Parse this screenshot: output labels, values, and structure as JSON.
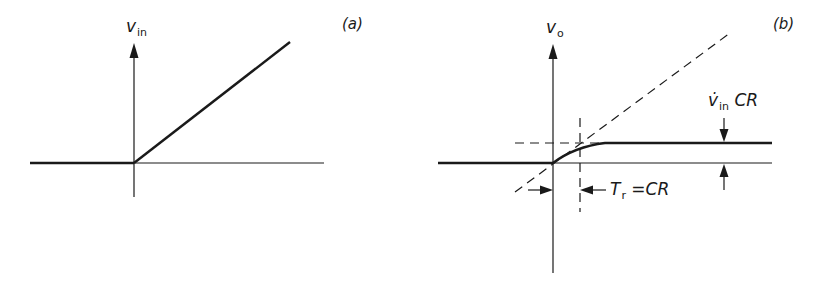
{
  "panels": {
    "a": {
      "tag": "(a)",
      "y_axis_label_main": "v",
      "y_axis_label_sub": "in",
      "description": "Input voltage ramp starting at t=0"
    },
    "b": {
      "tag": "(b)",
      "y_axis_label_main": "v",
      "y_axis_label_sub": "o",
      "amplitude_label_main": "v̇",
      "amplitude_label_sub": "in",
      "amplitude_label_tail": " CR",
      "time_constant_label_main": "T",
      "time_constant_label_sub": "r",
      "time_constant_label_tail": " =CR",
      "description": "Output voltage rising exponentially toward plateau v̇in·CR; dashed asymptote and time constant markers"
    }
  },
  "colors": {
    "ink": "#1a1a1a",
    "background": "#ffffff"
  }
}
